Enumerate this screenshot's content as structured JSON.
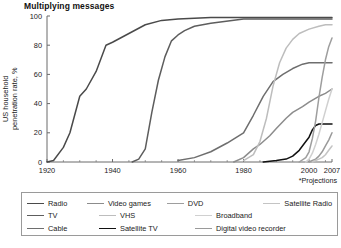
{
  "chart_data": {
    "type": "line",
    "title": "Multiplying messages",
    "xlabel": "",
    "ylabel_line1": "US household",
    "ylabel_line2": "penetration rate, %",
    "xlim": [
      1920,
      2007
    ],
    "ylim": [
      0,
      100
    ],
    "xticks": [
      "1920",
      "1940",
      "1960",
      "1980",
      "2000",
      "2007"
    ],
    "xtick_values": [
      1920,
      1940,
      1960,
      1980,
      2000,
      2007
    ],
    "yticks": [
      "0",
      "20",
      "40",
      "60",
      "80",
      "100"
    ],
    "ytick_values": [
      0,
      20,
      40,
      60,
      80,
      100
    ],
    "grid": false,
    "legend_position": "below-plot",
    "annotations": [
      {
        "text": "*Projections",
        "x": 2004,
        "y": -14
      },
      {
        "text": "*",
        "x": 2007,
        "y": 104
      }
    ],
    "series": [
      {
        "name": "Radio",
        "color": "#4a4a4a",
        "points": [
          [
            1920,
            0
          ],
          [
            1922,
            1
          ],
          [
            1925,
            10
          ],
          [
            1927,
            20
          ],
          [
            1930,
            45
          ],
          [
            1932,
            50
          ],
          [
            1935,
            62
          ],
          [
            1938,
            80
          ],
          [
            1940,
            82
          ],
          [
            1945,
            88
          ],
          [
            1950,
            94
          ],
          [
            1955,
            97
          ],
          [
            1960,
            98
          ],
          [
            1970,
            99
          ],
          [
            1980,
            99
          ],
          [
            1990,
            99
          ],
          [
            2000,
            99
          ],
          [
            2007,
            99
          ]
        ]
      },
      {
        "name": "TV",
        "color": "#5d5d5d",
        "points": [
          [
            1946,
            0
          ],
          [
            1948,
            2
          ],
          [
            1950,
            9
          ],
          [
            1952,
            34
          ],
          [
            1954,
            56
          ],
          [
            1956,
            72
          ],
          [
            1958,
            83
          ],
          [
            1960,
            87
          ],
          [
            1962,
            90
          ],
          [
            1965,
            93
          ],
          [
            1970,
            95
          ],
          [
            1980,
            98
          ],
          [
            1990,
            98
          ],
          [
            2000,
            98
          ],
          [
            2007,
            98
          ]
        ]
      },
      {
        "name": "Cable",
        "color": "#6e6e6e",
        "points": [
          [
            1960,
            1
          ],
          [
            1965,
            3
          ],
          [
            1970,
            7
          ],
          [
            1975,
            13
          ],
          [
            1980,
            20
          ],
          [
            1983,
            32
          ],
          [
            1986,
            45
          ],
          [
            1989,
            55
          ],
          [
            1992,
            60
          ],
          [
            1995,
            64
          ],
          [
            1998,
            67
          ],
          [
            2000,
            68
          ],
          [
            2003,
            68
          ],
          [
            2005,
            68
          ],
          [
            2007,
            68
          ]
        ]
      },
      {
        "name": "Video games",
        "color": "#8c8c8c",
        "points": [
          [
            1977,
            0
          ],
          [
            1980,
            3
          ],
          [
            1983,
            9
          ],
          [
            1985,
            12
          ],
          [
            1988,
            18
          ],
          [
            1990,
            23
          ],
          [
            1993,
            30
          ],
          [
            1995,
            34
          ],
          [
            1998,
            38
          ],
          [
            2000,
            41
          ],
          [
            2003,
            45
          ],
          [
            2005,
            47
          ],
          [
            2007,
            50
          ]
        ]
      },
      {
        "name": "VHS",
        "color": "#bdbdbd",
        "points": [
          [
            1980,
            1
          ],
          [
            1983,
            5
          ],
          [
            1985,
            14
          ],
          [
            1987,
            30
          ],
          [
            1989,
            52
          ],
          [
            1991,
            68
          ],
          [
            1993,
            78
          ],
          [
            1995,
            84
          ],
          [
            1997,
            88
          ],
          [
            2000,
            91
          ],
          [
            2003,
            93
          ],
          [
            2005,
            94
          ],
          [
            2007,
            94
          ]
        ]
      },
      {
        "name": "Satellite TV",
        "color": "#111111",
        "points": [
          [
            1986,
            0
          ],
          [
            1990,
            1
          ],
          [
            1993,
            2
          ],
          [
            1995,
            4
          ],
          [
            1997,
            8
          ],
          [
            1999,
            14
          ],
          [
            2000,
            17
          ],
          [
            2001,
            22
          ],
          [
            2002,
            25
          ],
          [
            2003,
            26
          ],
          [
            2005,
            26
          ],
          [
            2007,
            26
          ]
        ]
      },
      {
        "name": "DVD",
        "color": "#9e9e9e",
        "points": [
          [
            1997,
            0
          ],
          [
            1999,
            3
          ],
          [
            2000,
            7
          ],
          [
            2001,
            16
          ],
          [
            2002,
            28
          ],
          [
            2003,
            44
          ],
          [
            2004,
            58
          ],
          [
            2005,
            70
          ],
          [
            2006,
            79
          ],
          [
            2007,
            85
          ]
        ]
      },
      {
        "name": "Broadband",
        "color": "#d0d0d0",
        "points": [
          [
            1999,
            0
          ],
          [
            2000,
            2
          ],
          [
            2001,
            6
          ],
          [
            2002,
            12
          ],
          [
            2003,
            19
          ],
          [
            2004,
            27
          ],
          [
            2005,
            35
          ],
          [
            2006,
            43
          ],
          [
            2007,
            50
          ]
        ]
      },
      {
        "name": "Digital video recorder",
        "color": "#9a9a9a",
        "points": [
          [
            2000,
            0
          ],
          [
            2001,
            1
          ],
          [
            2002,
            2
          ],
          [
            2003,
            4
          ],
          [
            2004,
            7
          ],
          [
            2005,
            11
          ],
          [
            2006,
            15
          ],
          [
            2007,
            20
          ]
        ]
      },
      {
        "name": "Satellite Radio",
        "color": "#c4c4c4",
        "points": [
          [
            2001,
            0
          ],
          [
            2002,
            1
          ],
          [
            2003,
            2
          ],
          [
            2004,
            3
          ],
          [
            2005,
            5
          ],
          [
            2006,
            8
          ],
          [
            2007,
            11
          ]
        ]
      }
    ]
  },
  "legend": {
    "rows": [
      [
        {
          "label": "Radio",
          "color": "#4a4a4a"
        },
        {
          "label": "Video games",
          "color": "#8c8c8c"
        },
        {
          "label": "DVD",
          "color": "#9e9e9e"
        },
        {
          "label": "Satellite Radio",
          "color": "#c4c4c4"
        }
      ],
      [
        {
          "label": "TV",
          "color": "#5d5d5d"
        },
        {
          "label": "VHS",
          "color": "#bdbdbd"
        },
        {
          "label": "Broadband",
          "color": "#d0d0d0"
        },
        {
          "label": "",
          "color": ""
        }
      ],
      [
        {
          "label": "Cable",
          "color": "#6e6e6e"
        },
        {
          "label": "Satellite TV",
          "color": "#111111"
        },
        {
          "label": "Digital video recorder",
          "color": "#9a9a9a"
        },
        {
          "label": "",
          "color": ""
        }
      ]
    ]
  },
  "source": ""
}
